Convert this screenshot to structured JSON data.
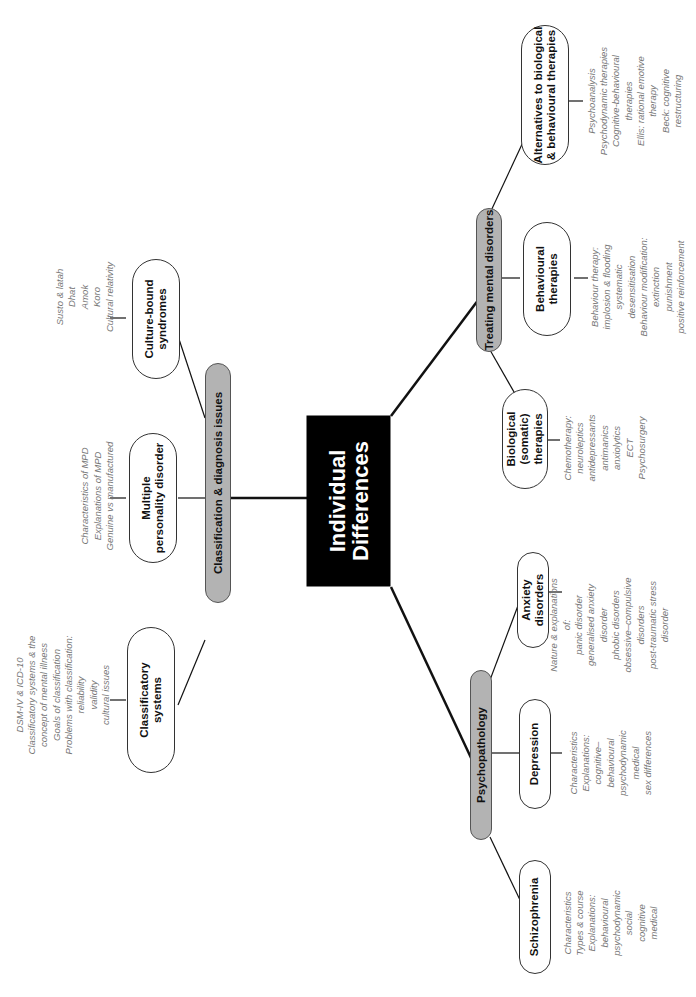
{
  "central": {
    "title_line1": "Individual",
    "title_line2": "Differences"
  },
  "branches": {
    "classification": {
      "label": "Classification & diagnosis issues",
      "children": {
        "classificatory": {
          "label_line1": "Classificatory",
          "label_line2": "systems",
          "notes": [
            "DSM-IV & ICD-10",
            "Classificatory systems & the",
            "concept of mental illness",
            "Goals of classification",
            "Problems with classification:",
            "reliability",
            "validity",
            "cultural issues"
          ]
        },
        "mpd": {
          "label_line1": "Multiple",
          "label_line2": "personality disorder",
          "notes": [
            "Characteristics of MPD",
            "Explanations of MPD",
            "Genuine vs manufactured"
          ]
        },
        "culture_bound": {
          "label_line1": "Culture-bound",
          "label_line2": "syndromes",
          "notes": [
            "Susto & latah",
            "Dhat",
            "Amok",
            "Koro",
            "Cultural relativity"
          ]
        }
      }
    },
    "treating": {
      "label": "Treating mental disorders",
      "children": {
        "biological": {
          "label_line1": "Biological",
          "label_line2": "(somatic) therapies",
          "notes": [
            "Chemotherapy:",
            "neuroleptics",
            "antidepressants",
            "antimanics",
            "anxiolytics",
            "ECT",
            "Psychosurgery"
          ]
        },
        "behavioural": {
          "label_line1": "Behavioural",
          "label_line2": "therapies",
          "notes": [
            "Behaviour therapy:",
            "implosion & flooding",
            "systematic",
            "desensitisation",
            "Behaviour modification:",
            "extinction",
            "punishment",
            "positive reinforcement"
          ]
        },
        "alternatives": {
          "label_line1": "Alternatives to biological",
          "label_line2": "& behavioural therapies",
          "notes": [
            "Psychoanalysis",
            "Psychodynamic therapies",
            "Cognitive-behavioural",
            "therapies",
            "Ellis: rational emotive",
            "therapy",
            "Beck: cognitive",
            "restructuring"
          ]
        }
      }
    },
    "psychopathology": {
      "label": "Psychopathology",
      "children": {
        "schizophrenia": {
          "label": "Schizophrenia",
          "notes": [
            "Characteristics",
            "Types & course",
            "Explanations:",
            "behavioural",
            "psychodynamic",
            "social",
            "cognitive",
            "medical"
          ]
        },
        "depression": {
          "label": "Depression",
          "notes": [
            "Characteristics",
            "Explanations:",
            "cognitive–",
            "behavioural",
            "psychodynamic",
            "medical",
            "sex differences"
          ]
        },
        "anxiety": {
          "label": "Anxiety disorders",
          "notes": [
            "Nature & explanations",
            "of:",
            "panic disorder",
            "generalised anxiety",
            "disorder",
            "phobic disorders",
            "obsessive–compulsive",
            "disorders",
            "post-traumatic stress",
            "disorder"
          ]
        }
      }
    }
  },
  "colors": {
    "central_bg": "#000000",
    "branch_bg": "#b3b3b3",
    "leaf_bg": "#ffffff",
    "notes_text": "#777777",
    "line": "#111111"
  }
}
